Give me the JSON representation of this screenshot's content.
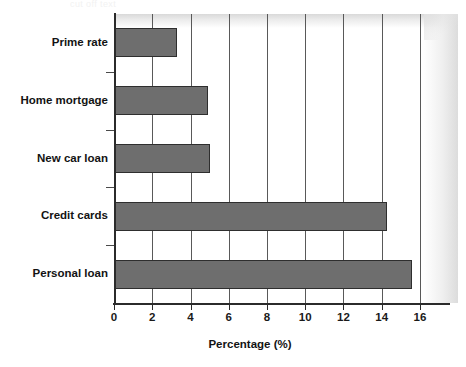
{
  "artifact": {
    "top_text": "cut off text"
  },
  "chart_data": {
    "type": "bar",
    "orientation": "horizontal",
    "title": "",
    "subtitle": "",
    "xlabel": "Percentage (%)",
    "ylabel": "",
    "categories": [
      "Prime rate",
      "Home mortgage",
      "New car loan",
      "Credit cards",
      "Personal loan"
    ],
    "values": [
      3.3,
      4.9,
      5.0,
      14.3,
      15.6
    ],
    "series": [
      {
        "name": "Percentage",
        "values": [
          3.3,
          4.9,
          5.0,
          14.3,
          15.6
        ]
      }
    ],
    "xlim": [
      0,
      17.6
    ],
    "xticks": [
      0,
      2,
      4,
      6,
      8,
      10,
      12,
      14,
      16
    ],
    "xtick_labels": [
      "0",
      "2",
      "4",
      "6",
      "8",
      "10",
      "12",
      "14",
      "16"
    ],
    "grid": "vertical",
    "legend": "none",
    "bar_color": "#6e6e6e",
    "bar_edge_color": "#2e2e2e",
    "axis_color": "#2b2b2b",
    "gridline_color": "#595959",
    "text_color": "#131313",
    "background_color": "#ffffff"
  }
}
